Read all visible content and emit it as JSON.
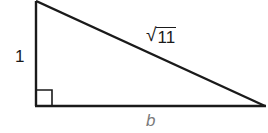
{
  "diagram": {
    "type": "right-triangle",
    "right_angle_vertex": "bottom-left",
    "stroke_color": "#1a1a1a",
    "labels": {
      "height": "1",
      "hypotenuse_radical": "√",
      "hypotenuse_radicand": "11",
      "base": "b"
    },
    "vertices": {
      "top": [
        36,
        1
      ],
      "bottom_left": [
        36,
        106
      ],
      "bottom_right": [
        265,
        106
      ]
    },
    "right_angle_marker_size": 16
  }
}
